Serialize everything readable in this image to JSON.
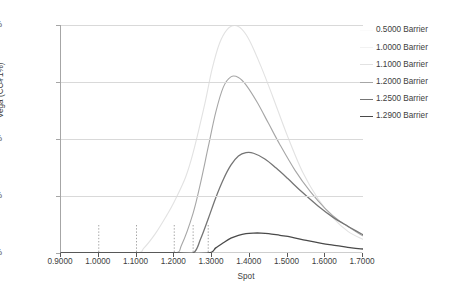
{
  "chart_data": {
    "type": "line",
    "title": "",
    "xlabel": "Spot",
    "ylabel": "Vega (CCY1%)",
    "xlim": [
      0.9,
      1.7
    ],
    "ylim": [
      0.0,
      0.004
    ],
    "xticks": [
      "0.9000",
      "1.0000",
      "1.1000",
      "1.2000",
      "1.3000",
      "1.4000",
      "1.5000",
      "1.6000",
      "1.7000"
    ],
    "xtick_values": [
      0.9,
      1.0,
      1.1,
      1.2,
      1.3,
      1.4,
      1.5,
      1.6,
      1.7
    ],
    "yticks": [
      "0.00%",
      "0.10%",
      "0.20%",
      "0.30%",
      "0.40%"
    ],
    "ytick_values": [
      0.0,
      0.001,
      0.002,
      0.003,
      0.004
    ],
    "grid": "horizontal",
    "legend_position": "right",
    "barrier_markers": [
      1.0,
      1.1,
      1.2,
      1.25,
      1.29
    ],
    "series": [
      {
        "name": "0.5000 Barrier",
        "color": "#fbfbfb",
        "barrier": 0.5,
        "x": [
          0.9,
          1.0,
          1.1,
          1.2,
          1.3,
          1.4,
          1.5,
          1.6,
          1.7
        ],
        "values": [
          0.0,
          0.0,
          0.0,
          0.0,
          0.0,
          0.0,
          0.0,
          0.0,
          0.0
        ]
      },
      {
        "name": "1.0000 Barrier",
        "color": "#f2f2f2",
        "barrier": 1.0,
        "x": [
          0.9,
          1.0,
          1.1,
          1.2,
          1.3,
          1.4,
          1.5,
          1.6,
          1.7
        ],
        "values": [
          0.0,
          0.0,
          0.0,
          0.0,
          0.0,
          0.0,
          0.0,
          0.0,
          0.0
        ]
      },
      {
        "name": "1.1000 Barrier",
        "color": "#e2e2e2",
        "barrier": 1.1,
        "x": [
          0.9,
          1.0,
          1.1,
          1.12,
          1.15,
          1.18,
          1.2,
          1.23,
          1.25,
          1.28,
          1.3,
          1.32,
          1.34,
          1.36,
          1.38,
          1.4,
          1.43,
          1.46,
          1.5,
          1.54,
          1.58,
          1.62,
          1.66,
          1.7
        ],
        "values": [
          0.0,
          0.0,
          0.0,
          9e-05,
          0.00034,
          0.00066,
          0.0009,
          0.00133,
          0.00176,
          0.00259,
          0.00322,
          0.00368,
          0.00392,
          0.00399,
          0.00392,
          0.00372,
          0.00327,
          0.00276,
          0.00205,
          0.00142,
          0.00096,
          0.00062,
          0.00038,
          0.00024
        ]
      },
      {
        "name": "1.2000 Barrier",
        "color": "#a6a6a6",
        "barrier": 1.2,
        "x": [
          0.9,
          1.0,
          1.1,
          1.2,
          1.22,
          1.25,
          1.27,
          1.29,
          1.31,
          1.33,
          1.35,
          1.37,
          1.39,
          1.42,
          1.45,
          1.48,
          1.52,
          1.56,
          1.6,
          1.64,
          1.7
        ],
        "values": [
          0.0,
          0.0,
          0.0,
          0.0,
          0.00015,
          0.0007,
          0.00124,
          0.00186,
          0.00247,
          0.00291,
          0.00309,
          0.00308,
          0.00295,
          0.00264,
          0.00227,
          0.0019,
          0.00145,
          0.00108,
          0.00078,
          0.00055,
          0.0003
        ]
      },
      {
        "name": "1.2500 Barrier",
        "color": "#757575",
        "barrier": 1.25,
        "x": [
          0.9,
          1.0,
          1.1,
          1.2,
          1.25,
          1.27,
          1.29,
          1.31,
          1.33,
          1.35,
          1.37,
          1.39,
          1.41,
          1.44,
          1.47,
          1.5,
          1.54,
          1.58,
          1.62,
          1.66,
          1.7
        ],
        "values": [
          0.0,
          0.0,
          0.0,
          0.0,
          0.0,
          0.00025,
          0.0006,
          0.00097,
          0.00129,
          0.00154,
          0.0017,
          0.00176,
          0.00175,
          0.00165,
          0.00149,
          0.00131,
          0.00106,
          0.00083,
          0.00063,
          0.00047,
          0.00032
        ]
      },
      {
        "name": "1.2900 Barrier",
        "color": "#4a4a4a",
        "barrier": 1.29,
        "x": [
          0.9,
          1.0,
          1.1,
          1.2,
          1.29,
          1.31,
          1.33,
          1.35,
          1.37,
          1.39,
          1.41,
          1.43,
          1.45,
          1.48,
          1.51,
          1.55,
          1.59,
          1.63,
          1.67,
          1.7
        ],
        "values": [
          0.0,
          0.0,
          0.0,
          0.0,
          0.0,
          9e-05,
          0.00018,
          0.00026,
          0.00031,
          0.00034,
          0.00035,
          0.00035,
          0.00034,
          0.00031,
          0.00028,
          0.00022,
          0.00017,
          0.00013,
          9e-05,
          7e-05
        ]
      }
    ]
  }
}
